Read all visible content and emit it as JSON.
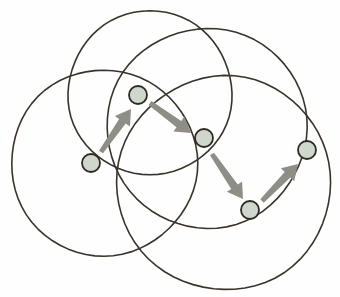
{
  "figure": {
    "width": 340,
    "height": 297,
    "background_color": "#fefefe"
  },
  "style": {
    "circle_stroke_color": "#3a332a",
    "circle_stroke_width": 1.6,
    "node_fill_color": "#cfd6cb",
    "node_stroke_color": "#2e2a24",
    "node_stroke_width": 1.8,
    "node_radius": 9,
    "arrow_color": "#8e8e87",
    "arrow_edge_color": "#7a7a73"
  },
  "circles": [
    {
      "name": "circle-top",
      "cx": 150,
      "cy": 93,
      "r": 82
    },
    {
      "name": "circle-left",
      "cx": 104,
      "cy": 163,
      "r": 93
    },
    {
      "name": "circle-upper-right",
      "cx": 207,
      "cy": 128,
      "r": 100
    },
    {
      "name": "circle-lower-right",
      "cx": 224,
      "cy": 183,
      "r": 107
    }
  ],
  "nodes": [
    {
      "name": "node-top",
      "label": "node-top",
      "cx": 138,
      "cy": 95
    },
    {
      "name": "node-left",
      "label": "node-left",
      "cx": 91,
      "cy": 163
    },
    {
      "name": "node-middle",
      "label": "node-middle",
      "cx": 204,
      "cy": 138
    },
    {
      "name": "node-bottom",
      "label": "node-bottom",
      "cx": 250,
      "cy": 210
    },
    {
      "name": "node-right",
      "label": "node-right",
      "cx": 307,
      "cy": 150
    }
  ],
  "arrows": [
    {
      "name": "arrow-left-to-top",
      "from": "node-left",
      "to": "node-top",
      "x1": 101,
      "y1": 152,
      "x2": 131,
      "y2": 109,
      "width": 8
    },
    {
      "name": "arrow-top-to-middle",
      "from": "node-top",
      "to": "node-middle",
      "x1": 150,
      "y1": 103,
      "x2": 191,
      "y2": 133,
      "width": 8
    },
    {
      "name": "arrow-middle-to-bottom",
      "from": "node-middle",
      "to": "node-bottom",
      "x1": 212,
      "y1": 154,
      "x2": 243,
      "y2": 199,
      "width": 8
    },
    {
      "name": "arrow-bottom-to-right",
      "from": "node-bottom",
      "to": "node-right",
      "x1": 262,
      "y1": 201,
      "x2": 298,
      "y2": 164,
      "width": 8
    }
  ]
}
